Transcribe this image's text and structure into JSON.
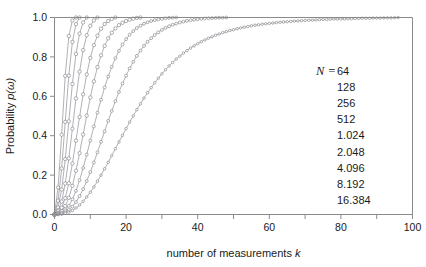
{
  "chart_data": {
    "type": "line",
    "title": "",
    "xlabel": "number of measurements k",
    "xlabel_plain": "number of measurements",
    "xlabel_italic": "k",
    "ylabel": "Probability p(ω)",
    "ylabel_plain": "Probability",
    "ylabel_italic": "p(ω)",
    "xlim": [
      0,
      100
    ],
    "ylim": [
      0,
      1.0
    ],
    "xticks": [
      0,
      20,
      40,
      60,
      80,
      100
    ],
    "xtick_labels": [
      "0",
      "20",
      "40",
      "60",
      "80",
      "100"
    ],
    "xminor_ticks": [
      10,
      30,
      50,
      70,
      90
    ],
    "yticks": [
      0.0,
      0.2,
      0.4,
      0.6,
      0.8,
      1.0
    ],
    "ytick_labels": [
      "0.0",
      "0.2",
      "0.4",
      "0.6",
      "0.8",
      "1.0"
    ],
    "grid": false,
    "marker": "open-circle",
    "line_color": "#8f8f96",
    "marker_edge_color": "#6f6f78",
    "legend_position": "inside-right",
    "legend_prefix": "N =",
    "series": [
      {
        "name": "64",
        "label": "64",
        "k_max": 6,
        "values": [
          0.0,
          0.137,
          0.405,
          0.704,
          0.906,
          0.985,
          1.0
        ]
      },
      {
        "name": "128",
        "label": "128",
        "k_max": 7,
        "values": [
          0.0,
          0.07,
          0.234,
          0.47,
          0.705,
          0.876,
          0.966,
          1.0
        ]
      },
      {
        "name": "256",
        "label": "256",
        "k_max": 9,
        "values": [
          0.0,
          0.036,
          0.127,
          0.281,
          0.473,
          0.663,
          0.815,
          0.918,
          0.975,
          1.0
        ]
      },
      {
        "name": "512",
        "label": "512",
        "k_max": 12,
        "values": [
          0.0,
          0.018,
          0.066,
          0.157,
          0.285,
          0.436,
          0.589,
          0.725,
          0.834,
          0.91,
          0.958,
          0.985,
          1.0
        ]
      },
      {
        "name": "1.024",
        "label": "1.024",
        "k_max": 17,
        "values": [
          0.0,
          0.009,
          0.034,
          0.083,
          0.159,
          0.259,
          0.375,
          0.495,
          0.61,
          0.711,
          0.795,
          0.86,
          0.908,
          0.943,
          0.967,
          0.982,
          0.993,
          1.0
        ]
      },
      {
        "name": "2.048",
        "label": "2.048",
        "k_max": 24,
        "values": [
          0.0,
          0.005,
          0.017,
          0.043,
          0.085,
          0.145,
          0.222,
          0.311,
          0.406,
          0.502,
          0.594,
          0.676,
          0.748,
          0.808,
          0.856,
          0.894,
          0.923,
          0.945,
          0.961,
          0.973,
          0.982,
          0.989,
          0.994,
          0.998,
          1.0
        ]
      },
      {
        "name": "4.096",
        "label": "4.096",
        "k_max": 34,
        "values": [
          0.0,
          0.002,
          0.009,
          0.022,
          0.044,
          0.077,
          0.12,
          0.174,
          0.236,
          0.304,
          0.375,
          0.447,
          0.517,
          0.583,
          0.645,
          0.7,
          0.75,
          0.793,
          0.831,
          0.863,
          0.89,
          0.913,
          0.931,
          0.946,
          0.958,
          0.968,
          0.976,
          0.982,
          0.987,
          0.99,
          0.993,
          0.996,
          0.998,
          0.999,
          1.0
        ]
      },
      {
        "name": "8.192",
        "label": "8.192",
        "k_max": 48,
        "values": [
          0.0,
          0.001,
          0.004,
          0.011,
          0.023,
          0.04,
          0.063,
          0.093,
          0.129,
          0.17,
          0.215,
          0.264,
          0.316,
          0.369,
          0.422,
          0.475,
          0.526,
          0.575,
          0.622,
          0.665,
          0.705,
          0.742,
          0.775,
          0.805,
          0.832,
          0.856,
          0.877,
          0.895,
          0.911,
          0.925,
          0.937,
          0.947,
          0.956,
          0.963,
          0.969,
          0.975,
          0.979,
          0.983,
          0.986,
          0.989,
          0.991,
          0.993,
          0.995,
          0.996,
          0.997,
          0.998,
          0.999,
          0.999,
          1.0
        ]
      },
      {
        "name": "16.384",
        "label": "16.384",
        "k_max": 96,
        "values": [
          0.0,
          0.0006,
          0.002,
          0.006,
          0.012,
          0.021,
          0.033,
          0.048,
          0.067,
          0.089,
          0.113,
          0.14,
          0.169,
          0.2,
          0.232,
          0.265,
          0.299,
          0.334,
          0.368,
          0.402,
          0.436,
          0.469,
          0.501,
          0.532,
          0.562,
          0.591,
          0.618,
          0.644,
          0.669,
          0.692,
          0.714,
          0.735,
          0.754,
          0.772,
          0.789,
          0.804,
          0.819,
          0.832,
          0.845,
          0.856,
          0.867,
          0.877,
          0.886,
          0.895,
          0.902,
          0.91,
          0.916,
          0.923,
          0.928,
          0.934,
          0.938,
          0.943,
          0.947,
          0.951,
          0.954,
          0.958,
          0.961,
          0.963,
          0.966,
          0.968,
          0.97,
          0.972,
          0.974,
          0.976,
          0.977,
          0.979,
          0.98,
          0.982,
          0.983,
          0.984,
          0.985,
          0.986,
          0.987,
          0.988,
          0.989,
          0.99,
          0.99,
          0.991,
          0.992,
          0.992,
          0.993,
          0.993,
          0.994,
          0.994,
          0.995,
          0.995,
          0.996,
          0.996,
          0.996,
          0.997,
          0.997,
          0.997,
          0.998,
          0.998,
          0.998,
          0.999,
          1.0
        ]
      }
    ],
    "legend_entries": [
      "64",
      "128",
      "256",
      "512",
      "1.024",
      "2.048",
      "4.096",
      "8.192",
      "16.384"
    ]
  }
}
